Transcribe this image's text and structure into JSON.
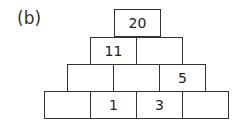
{
  "label": "(b)",
  "pyramid": {
    "rows": [
      [
        "20"
      ],
      [
        "11",
        ""
      ],
      [
        "",
        "",
        "5"
      ],
      [
        "",
        "1",
        "3",
        ""
      ]
    ]
  }
}
